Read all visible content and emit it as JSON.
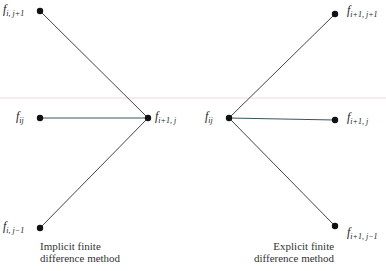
{
  "colors": {
    "line": "#444444",
    "node": "#111111",
    "rule": "#e8cfe0",
    "text": "#222222"
  },
  "rule_line": {
    "y": 98
  },
  "implicit": {
    "caption": [
      "Implicit finite",
      "difference method"
    ],
    "nodes": [
      {
        "id": "f_i_jp1",
        "base": "f",
        "sub": "i, j+1",
        "x": 40,
        "y": 11
      },
      {
        "id": "f_ij",
        "base": "f",
        "sub": "ij",
        "x": 40,
        "y": 118
      },
      {
        "id": "f_i_jm1",
        "base": "f",
        "sub": "i, j−1",
        "x": 40,
        "y": 228
      },
      {
        "id": "f_ip1_j",
        "base": "f",
        "sub": "i+1, j",
        "x": 148,
        "y": 118
      }
    ]
  },
  "explicit": {
    "caption": [
      "Explicit finite",
      "difference method"
    ],
    "nodes": [
      {
        "id": "f_ij",
        "base": "f",
        "sub": "ij",
        "x": 229,
        "y": 118
      },
      {
        "id": "f_ip1_jp1",
        "base": "f",
        "sub": "i+1, j+1",
        "x": 335,
        "y": 14
      },
      {
        "id": "f_ip1_j",
        "base": "f",
        "sub": "i+1, j",
        "x": 335,
        "y": 120
      },
      {
        "id": "f_ip1_jm1",
        "base": "f",
        "sub": "i+1, j−1",
        "x": 335,
        "y": 226
      }
    ]
  }
}
